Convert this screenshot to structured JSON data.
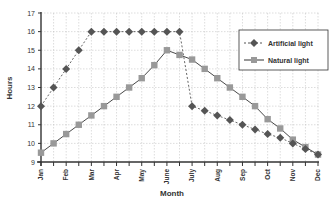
{
  "chart_data": {
    "type": "line",
    "title": "",
    "xlabel": "Month",
    "ylabel": "Hours",
    "ylim": [
      9,
      17
    ],
    "yticks": [
      9,
      10,
      11,
      12,
      13,
      14,
      15,
      16,
      17
    ],
    "grid": true,
    "legend_position": "upper right",
    "x_tick_labels": [
      "Jan",
      "Feb",
      "Mar",
      "Apr",
      "May",
      "June",
      "July",
      "Aug",
      "Sep",
      "Oct",
      "Nov",
      "Dec"
    ],
    "x": [
      0,
      0.5,
      1,
      1.5,
      2,
      2.5,
      3,
      3.5,
      4,
      4.5,
      5,
      5.5,
      6,
      6.5,
      7,
      7.5,
      8,
      8.5,
      9,
      9.5,
      10,
      10.5,
      11
    ],
    "series": [
      {
        "name": "Artificial light",
        "marker": "diamond",
        "line_style": "dashed",
        "color": "#555555",
        "values": [
          12,
          13,
          14,
          15,
          16,
          16,
          16,
          16,
          16,
          16,
          16,
          16,
          12,
          11.75,
          11.5,
          11.25,
          11,
          10.75,
          10.5,
          10.3,
          10,
          9.7,
          9.4
        ]
      },
      {
        "name": "Natural light",
        "marker": "square",
        "line_style": "solid",
        "color": "#999999",
        "values": [
          9.5,
          10,
          10.5,
          11,
          11.5,
          12,
          12.5,
          13,
          13.5,
          14.2,
          15,
          14.75,
          14.5,
          14,
          13.5,
          13,
          12.5,
          12,
          11.3,
          10.8,
          10.2,
          9.8,
          9.4
        ]
      }
    ]
  },
  "labels": {
    "ylabel": "Hours",
    "xlabel": "Month",
    "legend_artificial": "Artificial light",
    "legend_natural": "Natural light"
  }
}
